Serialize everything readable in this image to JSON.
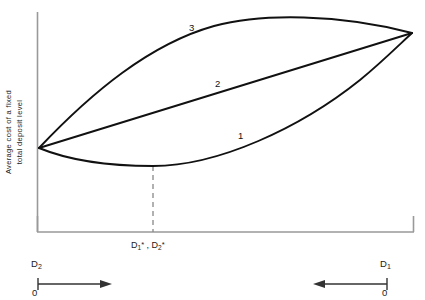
{
  "figure": {
    "y_axis_label_line1": "Average cost of a  fixed",
    "y_axis_label_line2": "total deposit level",
    "optimum_label_html": "D<sub>1</sub><sup>*</sup> , D<sub>2</sub><sup>*</sup>",
    "optimum_label_text": "D1*, D2*",
    "left_axis_var": "D",
    "left_axis_sub": "2",
    "left_axis_zero": "0",
    "right_axis_var": "D",
    "right_axis_sub": "1",
    "right_axis_zero": "0",
    "curve_label_1": "1",
    "curve_label_2": "2",
    "curve_label_3": "3",
    "line_color": "#111111",
    "axis_color": "#999999",
    "dash_color": "#888888",
    "background": "#ffffff"
  },
  "chart_data": {
    "type": "line",
    "title": "",
    "xlabel": "",
    "ylabel": "Average cost of a fixed total deposit level",
    "grid": false,
    "legend": "inline-curve-labels",
    "axis_notes": {
      "left_axis_direction": "D2 increases to the right from 0",
      "right_axis_direction": "D1 increases to the left from 0",
      "optimum_marker": "D1*, D2*"
    },
    "xlim": [
      0,
      1
    ],
    "ylim": [
      0,
      1
    ],
    "annotations": [
      {
        "text": "3",
        "x": 0.42,
        "y": 0.9
      },
      {
        "text": "2",
        "x": 0.5,
        "y": 0.63
      },
      {
        "text": "1",
        "x": 0.59,
        "y": 0.4
      },
      {
        "text": "D1*, D2*",
        "x": 0.31,
        "y": -0.07
      }
    ],
    "series": [
      {
        "name": "1",
        "description": "U-shaped (convex) lower cost curve with interior minimum at D1*, D2*",
        "shape": "convex",
        "x": [
          0.0,
          0.1,
          0.2,
          0.31,
          0.4,
          0.5,
          0.6,
          0.7,
          0.8,
          0.9,
          1.0
        ],
        "y": [
          0.38,
          0.3,
          0.25,
          0.23,
          0.25,
          0.3,
          0.38,
          0.49,
          0.62,
          0.78,
          0.95
        ]
      },
      {
        "name": "2",
        "description": "Straight line from left convergence point to right convergence point",
        "shape": "linear",
        "x": [
          0.0,
          0.25,
          0.5,
          0.75,
          1.0
        ],
        "y": [
          0.38,
          0.52,
          0.67,
          0.81,
          0.95
        ]
      },
      {
        "name": "3",
        "description": "Concave (hill-shaped) upper cost curve",
        "shape": "concave",
        "x": [
          0.0,
          0.1,
          0.2,
          0.31,
          0.4,
          0.5,
          0.6,
          0.7,
          0.8,
          0.9,
          1.0
        ],
        "y": [
          0.38,
          0.6,
          0.76,
          0.88,
          0.94,
          0.98,
          1.0,
          1.0,
          0.99,
          0.98,
          0.95
        ]
      }
    ],
    "reference_lines": [
      {
        "type": "vertical",
        "x": 0.31,
        "style": "dashed",
        "from_y": 0.0,
        "to_y": 0.23,
        "label": "D1*, D2*"
      }
    ]
  }
}
